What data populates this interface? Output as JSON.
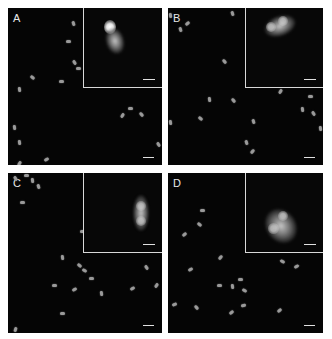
{
  "figure": {
    "panels": [
      {
        "label": "A",
        "rect": [
          8,
          8,
          154,
          157
        ],
        "inset": {
          "rect": [
            75,
            0,
            79,
            80
          ],
          "blobs": [
            {
              "x": 22,
              "y": 20,
              "w": 18,
              "h": 26,
              "rot": -15
            },
            {
              "x": 20,
              "y": 12,
              "w": 12,
              "h": 14,
              "rot": 0,
              "core": true
            }
          ]
        },
        "dots": [
          [
            63,
            14,
            70
          ],
          [
            58,
            32,
            0
          ],
          [
            64,
            53,
            60
          ],
          [
            68,
            59,
            0
          ],
          [
            22,
            68,
            40
          ],
          [
            51,
            72,
            0
          ],
          [
            9,
            80,
            80
          ],
          [
            120,
            99,
            0
          ],
          [
            112,
            106,
            -60
          ],
          [
            131,
            105,
            50
          ],
          [
            4,
            118,
            80
          ],
          [
            9,
            133,
            80
          ],
          [
            148,
            135,
            60
          ],
          [
            36,
            150,
            -30
          ],
          [
            9,
            154,
            -60
          ],
          [
            25,
            158,
            0
          ]
        ]
      },
      {
        "label": "B",
        "rect": [
          168,
          8,
          155,
          157
        ],
        "inset": {
          "rect": [
            77,
            0,
            78,
            80
          ],
          "blobs": [
            {
              "x": 18,
              "y": 8,
              "w": 32,
              "h": 20,
              "rot": -20
            },
            {
              "x": 20,
              "y": 14,
              "w": 10,
              "h": 10,
              "rot": 0,
              "core": true
            },
            {
              "x": 32,
              "y": 8,
              "w": 10,
              "h": 10,
              "rot": 0,
              "core": true
            }
          ]
        },
        "dots": [
          [
            62,
            4,
            70
          ],
          [
            17,
            14,
            -40
          ],
          [
            10,
            20,
            70
          ],
          [
            0,
            6,
            80
          ],
          [
            54,
            52,
            50
          ],
          [
            110,
            82,
            -60
          ],
          [
            39,
            90,
            80
          ],
          [
            63,
            91,
            50
          ],
          [
            140,
            87,
            0
          ],
          [
            132,
            100,
            80
          ],
          [
            143,
            104,
            60
          ],
          [
            30,
            109,
            40
          ],
          [
            0,
            113,
            80
          ],
          [
            83,
            112,
            70
          ],
          [
            150,
            119,
            80
          ],
          [
            76,
            133,
            70
          ],
          [
            82,
            142,
            -50
          ]
        ]
      },
      {
        "label": "C",
        "rect": [
          8,
          173,
          154,
          160
        ],
        "inset": {
          "rect": [
            75,
            0,
            79,
            80
          ],
          "blobs": [
            {
              "x": 49,
              "y": 22,
              "w": 16,
              "h": 36,
              "rot": 0
            },
            {
              "x": 52,
              "y": 28,
              "w": 10,
              "h": 10,
              "rot": 0,
              "core": true
            },
            {
              "x": 52,
              "y": 43,
              "w": 10,
              "h": 10,
              "rot": 0,
              "core": true
            }
          ]
        },
        "dots": [
          [
            5,
            4,
            60
          ],
          [
            16,
            1,
            0
          ],
          [
            22,
            6,
            80
          ],
          [
            28,
            12,
            70
          ],
          [
            12,
            28,
            0
          ],
          [
            72,
            57,
            0
          ],
          [
            52,
            83,
            80
          ],
          [
            69,
            91,
            40
          ],
          [
            74,
            96,
            30
          ],
          [
            81,
            104,
            0
          ],
          [
            44,
            111,
            0
          ],
          [
            64,
            115,
            -30
          ],
          [
            91,
            119,
            80
          ],
          [
            136,
            93,
            60
          ],
          [
            122,
            114,
            -30
          ],
          [
            146,
            111,
            -60
          ],
          [
            52,
            139,
            0
          ],
          [
            5,
            155,
            -70
          ]
        ]
      },
      {
        "label": "D",
        "rect": [
          168,
          173,
          155,
          160
        ],
        "inset": {
          "rect": [
            77,
            0,
            78,
            80
          ],
          "blobs": [
            {
              "x": 20,
              "y": 35,
              "w": 30,
              "h": 36,
              "rot": -35
            },
            {
              "x": 32,
              "y": 38,
              "w": 10,
              "h": 10,
              "rot": 0,
              "core": true
            },
            {
              "x": 22,
              "y": 50,
              "w": 11,
              "h": 11,
              "rot": 0,
              "core": true
            }
          ]
        },
        "dots": [
          [
            32,
            36,
            0
          ],
          [
            29,
            50,
            40
          ],
          [
            14,
            60,
            -40
          ],
          [
            50,
            83,
            -50
          ],
          [
            20,
            95,
            -30
          ],
          [
            112,
            87,
            30
          ],
          [
            126,
            92,
            -30
          ],
          [
            49,
            111,
            0
          ],
          [
            62,
            112,
            80
          ],
          [
            70,
            105,
            0
          ],
          [
            74,
            116,
            30
          ],
          [
            4,
            130,
            -20
          ],
          [
            26,
            133,
            50
          ],
          [
            61,
            138,
            -40
          ],
          [
            73,
            131,
            -10
          ],
          [
            109,
            136,
            -40
          ]
        ]
      }
    ],
    "scalebar_label": "",
    "colors": {
      "background": "#ffffff",
      "panel": "#050505",
      "border": "#d8d8d8",
      "label": "#e8e8e8",
      "dot": "#9a9a9a"
    }
  }
}
